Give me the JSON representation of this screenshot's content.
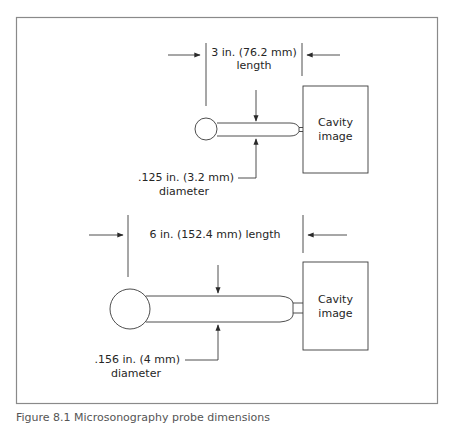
{
  "figure": {
    "frame_color": "#8a8a8a",
    "line_color": "#3a3a3a",
    "top_probe": {
      "length_label_line1": "3 in. (76.2 mm)",
      "length_label_line2": "length",
      "diameter_label_line1": ".125 in. (3.2 mm)",
      "diameter_label_line2": "diameter",
      "cavity_label_line1": "Cavity",
      "cavity_label_line2": "image"
    },
    "bottom_probe": {
      "length_label": "6 in. (152.4 mm) length",
      "diameter_label_line1": ".156 in. (4 mm)",
      "diameter_label_line2": "diameter",
      "cavity_label_line1": "Cavity",
      "cavity_label_line2": "image"
    },
    "caption": "Figure 8.1 Microsonography probe dimensions"
  }
}
